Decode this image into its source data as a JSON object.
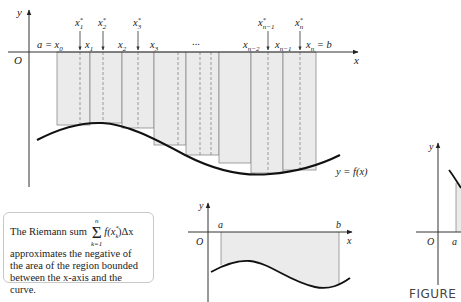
{
  "main_figure": {
    "axis_labels": {
      "y": "y",
      "x": "x",
      "origin": "O"
    },
    "partition_labels": [
      {
        "text": "a = x",
        "sub": "0"
      },
      {
        "text": "x",
        "sub": "1"
      },
      {
        "text": "x",
        "sub": "2"
      },
      {
        "text": "x",
        "sub": "3"
      },
      {
        "text": "...",
        "sub": ""
      },
      {
        "text": "x",
        "sub": "n−2"
      },
      {
        "text": "x",
        "sub": "n−1"
      },
      {
        "text": "x",
        "sub": "n",
        "suffix": " = b"
      }
    ],
    "sample_point_labels": [
      {
        "text": "x",
        "sup": "*",
        "sub": "1"
      },
      {
        "text": "x",
        "sup": "*",
        "sub": "2"
      },
      {
        "text": "x",
        "sup": "*",
        "sub": "3"
      },
      {
        "text": "x",
        "sup": "*",
        "sub": "n−1"
      },
      {
        "text": "x",
        "sup": "*",
        "sub": "n"
      }
    ],
    "curve_label": "y = f(x)",
    "colors": {
      "rect_fill": "#ebebeb",
      "rect_stroke": "#8a8a8a",
      "curve": "#111111",
      "axis": "#333333"
    }
  },
  "note": {
    "prefix": "The Riemann sum",
    "sigma_upper": "n",
    "sigma_lower": "k=1",
    "sigma": "Σ",
    "summand": "f(x*k)Δx",
    "summand_parts": {
      "f": "f(x",
      "sup": "*",
      "sub": "k",
      "close": ")Δx"
    },
    "body": "approximates the negative of the area of the region bounded between the x-axis and the curve."
  },
  "small_figure": {
    "axis_labels": {
      "y": "y",
      "x": "x",
      "origin": "O"
    },
    "bounds": {
      "a": "a",
      "b": "b"
    }
  },
  "right_figure": {
    "axis_labels": {
      "y": "y",
      "origin": "O"
    },
    "bounds": {
      "a": "a"
    }
  },
  "caption": "FIGURE"
}
